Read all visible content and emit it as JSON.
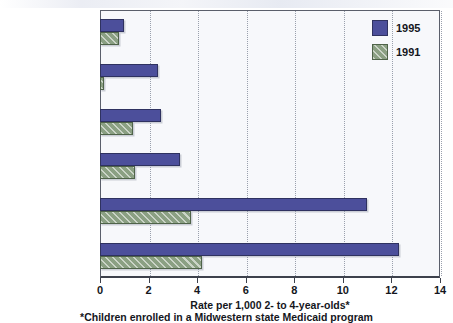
{
  "chart_data": {
    "type": "bar",
    "orientation": "horizontal",
    "title": "",
    "xlabel": "Rate per 1,000 2- to 4-year-olds*",
    "ylabel": "",
    "xlim": [
      0,
      14
    ],
    "xticks": [
      0,
      2,
      4,
      6,
      8,
      10,
      12,
      14
    ],
    "xtick_labels": [
      "0",
      "2",
      "4",
      "6",
      "8",
      "10",
      "12",
      "14"
    ],
    "grid": true,
    "grid_axis": "x",
    "legend_position": "top-right",
    "categories": [
      "Neuroleptics",
      "Clonidine",
      "Antidepressants (Tricyclic)",
      "Antidepressants (Total)",
      "Ritalin",
      "Stimulants"
    ],
    "category_lines": [
      [
        "Neuroleptics",
        ""
      ],
      [
        "Clonidine",
        ""
      ],
      [
        "Antidepressants",
        "(Tricyclic)"
      ],
      [
        "Antidepressants",
        "(Total)"
      ],
      [
        "Ritalin",
        ""
      ],
      [
        "Stimulants",
        ""
      ]
    ],
    "series": [
      {
        "name": "1995",
        "color": "#4c4f9b",
        "values": [
          1.0,
          2.4,
          2.5,
          3.3,
          11.0,
          12.3
        ]
      },
      {
        "name": "1991",
        "color": "#8ba083",
        "values": [
          0.8,
          0.15,
          1.35,
          1.45,
          3.75,
          4.2
        ]
      }
    ],
    "footnote": "*Children enrolled in a Midwestern state Medicaid program"
  },
  "legend": {
    "entries": [
      {
        "label": "1995",
        "swatch": "solid-blue-swatch"
      },
      {
        "label": "1991",
        "swatch": "hatched-green-swatch"
      }
    ]
  }
}
